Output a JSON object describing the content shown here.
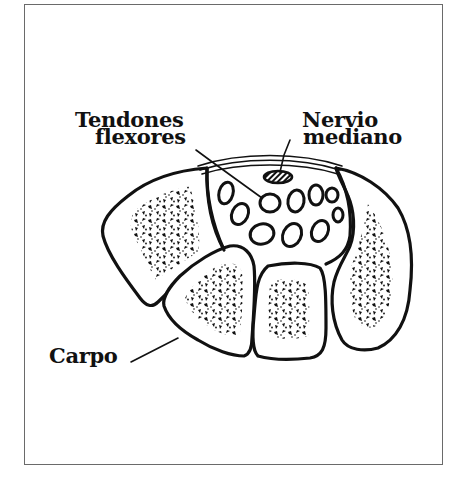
{
  "diagram": {
    "labels": {
      "flexor_tendons_line1": "Tendones",
      "flexor_tendons_line2": "flexores",
      "median_nerve_line1": "Nervio",
      "median_nerve_line2": "mediano",
      "carpus": "Carpo"
    },
    "colors": {
      "ink": "#111111",
      "frame": "#6a6a6a",
      "background": "#ffffff"
    },
    "components": {
      "tendon_count": 10,
      "carpal_bone_count": 4,
      "nerve_count": 1
    }
  }
}
